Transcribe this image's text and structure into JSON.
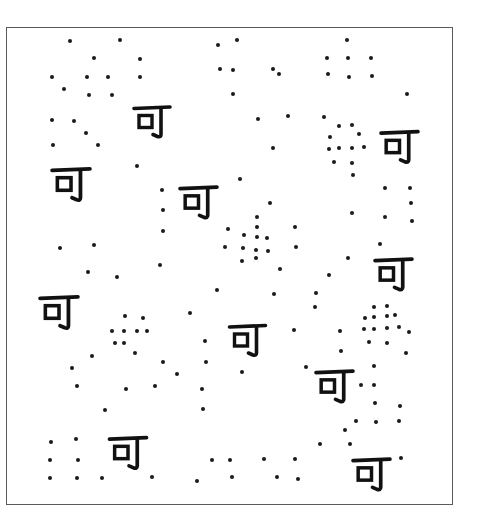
{
  "worksheet": {
    "frame": {
      "x": 6,
      "y": 27,
      "width": 447,
      "height": 478,
      "border_color": "#5a5a5a"
    },
    "dot_color": "#1a1a1a",
    "glyph_color": "#111111",
    "character": "可",
    "glyphs": [
      {
        "x": 132,
        "y": 103,
        "w": 40,
        "h": 37
      },
      {
        "x": 379,
        "y": 128,
        "w": 41,
        "h": 37
      },
      {
        "x": 50,
        "y": 165,
        "w": 42,
        "h": 38
      },
      {
        "x": 178,
        "y": 183,
        "w": 41,
        "h": 38
      },
      {
        "x": 373,
        "y": 255,
        "w": 41,
        "h": 38
      },
      {
        "x": 38,
        "y": 293,
        "w": 42,
        "h": 38
      },
      {
        "x": 227,
        "y": 322,
        "w": 41,
        "h": 36
      },
      {
        "x": 314,
        "y": 367,
        "w": 41,
        "h": 38
      },
      {
        "x": 107,
        "y": 434,
        "w": 42,
        "h": 37
      },
      {
        "x": 351,
        "y": 455,
        "w": 41,
        "h": 38
      }
    ],
    "dots": [
      [
        70,
        41
      ],
      [
        120,
        40
      ],
      [
        94,
        58
      ],
      [
        140,
        59
      ],
      [
        52,
        77
      ],
      [
        87,
        77
      ],
      [
        108,
        77
      ],
      [
        140,
        77
      ],
      [
        64,
        89
      ],
      [
        89,
        95
      ],
      [
        112,
        95
      ],
      [
        52,
        120
      ],
      [
        74,
        121
      ],
      [
        86,
        133
      ],
      [
        53,
        145
      ],
      [
        98,
        145
      ],
      [
        218,
        45
      ],
      [
        237,
        40
      ],
      [
        220,
        69
      ],
      [
        233,
        70
      ],
      [
        273,
        69
      ],
      [
        279,
        74
      ],
      [
        233,
        94
      ],
      [
        258,
        119
      ],
      [
        288,
        116
      ],
      [
        273,
        148
      ],
      [
        347,
        40
      ],
      [
        327,
        58
      ],
      [
        348,
        58
      ],
      [
        371,
        58
      ],
      [
        328,
        74
      ],
      [
        349,
        77
      ],
      [
        372,
        76
      ],
      [
        407,
        94
      ],
      [
        324,
        117
      ],
      [
        339,
        126
      ],
      [
        352,
        125
      ],
      [
        330,
        137
      ],
      [
        359,
        134
      ],
      [
        329,
        149
      ],
      [
        339,
        148
      ],
      [
        352,
        148
      ],
      [
        364,
        147
      ],
      [
        334,
        162
      ],
      [
        352,
        163
      ],
      [
        353,
        175
      ],
      [
        385,
        188
      ],
      [
        410,
        188
      ],
      [
        411,
        203
      ],
      [
        352,
        213
      ],
      [
        385,
        217
      ],
      [
        412,
        221
      ],
      [
        137,
        166
      ],
      [
        162,
        190
      ],
      [
        163,
        210
      ],
      [
        163,
        231
      ],
      [
        60,
        248
      ],
      [
        94,
        245
      ],
      [
        88,
        272
      ],
      [
        117,
        277
      ],
      [
        160,
        265
      ],
      [
        240,
        179
      ],
      [
        270,
        203
      ],
      [
        257,
        217
      ],
      [
        228,
        229
      ],
      [
        257,
        227
      ],
      [
        244,
        235
      ],
      [
        257,
        237
      ],
      [
        267,
        238
      ],
      [
        225,
        247
      ],
      [
        243,
        248
      ],
      [
        256,
        250
      ],
      [
        268,
        251
      ],
      [
        242,
        261
      ],
      [
        256,
        258
      ],
      [
        280,
        269
      ],
      [
        295,
        227
      ],
      [
        296,
        247
      ],
      [
        217,
        290
      ],
      [
        190,
        313
      ],
      [
        125,
        316
      ],
      [
        143,
        318
      ],
      [
        112,
        331
      ],
      [
        124,
        331
      ],
      [
        137,
        331
      ],
      [
        147,
        331
      ],
      [
        115,
        343
      ],
      [
        124,
        343
      ],
      [
        135,
        353
      ],
      [
        92,
        356
      ],
      [
        72,
        368
      ],
      [
        163,
        362
      ],
      [
        177,
        374
      ],
      [
        205,
        341
      ],
      [
        206,
        362
      ],
      [
        77,
        386
      ],
      [
        126,
        389
      ],
      [
        155,
        386
      ],
      [
        202,
        389
      ],
      [
        105,
        410
      ],
      [
        203,
        409
      ],
      [
        274,
        294
      ],
      [
        316,
        293
      ],
      [
        315,
        307
      ],
      [
        294,
        330
      ],
      [
        242,
        372
      ],
      [
        306,
        367
      ],
      [
        329,
        275
      ],
      [
        380,
        244
      ],
      [
        348,
        258
      ],
      [
        374,
        307
      ],
      [
        387,
        306
      ],
      [
        365,
        318
      ],
      [
        374,
        317
      ],
      [
        387,
        316
      ],
      [
        395,
        315
      ],
      [
        364,
        329
      ],
      [
        374,
        329
      ],
      [
        387,
        328
      ],
      [
        399,
        327
      ],
      [
        409,
        332
      ],
      [
        340,
        331
      ],
      [
        369,
        342
      ],
      [
        387,
        343
      ],
      [
        341,
        351
      ],
      [
        406,
        353
      ],
      [
        374,
        366
      ],
      [
        361,
        385
      ],
      [
        374,
        385
      ],
      [
        375,
        403
      ],
      [
        400,
        406
      ],
      [
        356,
        421
      ],
      [
        376,
        422
      ],
      [
        399,
        421
      ],
      [
        345,
        430
      ],
      [
        320,
        444
      ],
      [
        350,
        444
      ],
      [
        295,
        459
      ],
      [
        298,
        479
      ],
      [
        401,
        458
      ],
      [
        51,
        442
      ],
      [
        76,
        439
      ],
      [
        50,
        460
      ],
      [
        78,
        460
      ],
      [
        50,
        478
      ],
      [
        77,
        478
      ],
      [
        102,
        478
      ],
      [
        152,
        477
      ],
      [
        197,
        481
      ],
      [
        212,
        460
      ],
      [
        230,
        460
      ],
      [
        264,
        459
      ],
      [
        232,
        477
      ],
      [
        277,
        477
      ]
    ]
  }
}
